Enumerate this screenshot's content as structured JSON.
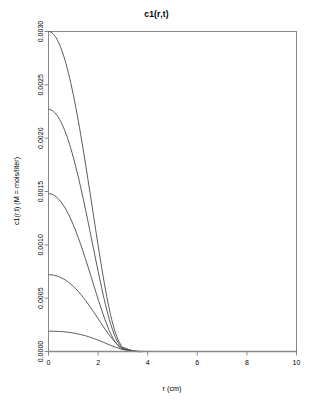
{
  "chart_data": {
    "type": "line",
    "title": "c1(r,t)",
    "xlabel": "r (cm)",
    "ylabel": "c1(r,t) (M = mols/liter)",
    "xlim": [
      0,
      10
    ],
    "ylim": [
      0,
      0.003
    ],
    "grid": false,
    "legend": "none",
    "xticks": [
      0,
      2,
      4,
      6,
      8,
      10
    ],
    "xtick_labels": [
      "0",
      "2",
      "4",
      "6",
      "8",
      "10"
    ],
    "yticks": [
      0.0,
      0.0005,
      0.001,
      0.0015,
      0.002,
      0.0025,
      0.003
    ],
    "ytick_labels": [
      "0.0000",
      "0.0005",
      "0.0010",
      "0.0015",
      "0.0020",
      "0.0025",
      "0.0030"
    ],
    "x": [
      0,
      0.1,
      0.2,
      0.3,
      0.4,
      0.5,
      0.6,
      0.7,
      0.8,
      0.9,
      1.0,
      1.1,
      1.2,
      1.3,
      1.4,
      1.5,
      1.6,
      1.7,
      1.8,
      1.9,
      2.0,
      2.1,
      2.2,
      2.3,
      2.4,
      2.5,
      2.6,
      2.7,
      2.8,
      2.9,
      3.0,
      3.5,
      4.0,
      5.0,
      6.0,
      7.0,
      8.0,
      9.0,
      10.0
    ],
    "series": [
      {
        "name": "t1",
        "peak": 0.003,
        "values": [
          0.003,
          0.002994,
          0.002975,
          0.002944,
          0.002901,
          0.002846,
          0.00278,
          0.002702,
          0.002614,
          0.002515,
          0.002407,
          0.002289,
          0.002164,
          0.002031,
          0.001892,
          0.001748,
          0.0016,
          0.001449,
          0.001297,
          0.001145,
          0.000995,
          0.000849,
          0.000709,
          0.000577,
          0.000456,
          0.000347,
          0.000253,
          0.000175,
          0.000114,
          7e-05,
          4e-05,
          2.5e-06,
          8e-08,
          0.0,
          0.0,
          0.0,
          0.0,
          0.0,
          0.0
        ]
      },
      {
        "name": "t2",
        "peak": 0.00227,
        "values": [
          0.00227,
          0.002265,
          0.002251,
          0.002227,
          0.002195,
          0.002153,
          0.002103,
          0.002045,
          0.001978,
          0.001903,
          0.001821,
          0.001732,
          0.001637,
          0.001537,
          0.001432,
          0.001323,
          0.001211,
          0.001096,
          0.000981,
          0.000866,
          0.000753,
          0.000643,
          0.000536,
          0.000437,
          0.000345,
          0.000263,
          0.000192,
          0.000132,
          8.6e-05,
          5.3e-05,
          3e-05,
          1.9e-06,
          6e-08,
          0.0,
          0.0,
          0.0,
          0.0,
          0.0,
          0.0
        ]
      },
      {
        "name": "t3",
        "peak": 0.00148,
        "values": [
          0.00148,
          0.001477,
          0.001468,
          0.001452,
          0.001431,
          0.001404,
          0.001371,
          0.001333,
          0.00129,
          0.001241,
          0.001187,
          0.001129,
          0.001067,
          0.001002,
          0.000933,
          0.000862,
          0.000789,
          0.000715,
          0.00064,
          0.000565,
          0.000491,
          0.000419,
          0.00035,
          0.000285,
          0.000225,
          0.000171,
          0.000125,
          8.6e-05,
          5.6e-05,
          3.5e-05,
          2e-05,
          1.2e-06,
          4e-08,
          0.0,
          0.0,
          0.0,
          0.0,
          0.0,
          0.0
        ]
      },
      {
        "name": "t4",
        "peak": 0.00072,
        "values": [
          0.00072,
          0.000719,
          0.000716,
          0.000711,
          0.000703,
          0.000693,
          0.000681,
          0.000667,
          0.000651,
          0.000632,
          0.000611,
          0.000588,
          0.000563,
          0.000536,
          0.000507,
          0.000477,
          0.000445,
          0.000412,
          0.000378,
          0.000343,
          0.000308,
          0.000272,
          0.000237,
          0.000203,
          0.00017,
          0.000139,
          0.00011,
          8.4e-05,
          6.2e-05,
          4.4e-05,
          3e-05,
          3.7e-06,
          3e-07,
          0.0,
          0.0,
          0.0,
          0.0,
          0.0,
          0.0
        ]
      },
      {
        "name": "t5",
        "peak": 0.00019,
        "values": [
          0.00019,
          0.00019,
          0.00019,
          0.000189,
          0.000188,
          0.000187,
          0.000185,
          0.000183,
          0.00018,
          0.000177,
          0.000173,
          0.000169,
          0.000164,
          0.000159,
          0.000153,
          0.000147,
          0.00014,
          0.000132,
          0.000124,
          0.000116,
          0.000107,
          9.75e-05,
          8.78e-05,
          7.79e-05,
          6.81e-05,
          5.85e-05,
          4.92e-05,
          4.05e-05,
          3.25e-05,
          2.54e-05,
          1.93e-05,
          4.3e-06,
          6e-07,
          0.0,
          0.0,
          0.0,
          0.0,
          0.0,
          0.0
        ]
      },
      {
        "name": "baseline",
        "peak": 0.0,
        "values": [
          0,
          0,
          0,
          0,
          0,
          0,
          0,
          0,
          0,
          0,
          0,
          0,
          0,
          0,
          0,
          0,
          0,
          0,
          0,
          0,
          0,
          0,
          0,
          0,
          0,
          0,
          0,
          0,
          0,
          0,
          0,
          0,
          0,
          0,
          0,
          0,
          0,
          0,
          0
        ]
      }
    ]
  },
  "colors": {
    "curve": "#4a4a4a",
    "baseline": "#8a8a8a",
    "frame": "#8a8a8a",
    "background": "#ffffff",
    "text": "#000000"
  }
}
